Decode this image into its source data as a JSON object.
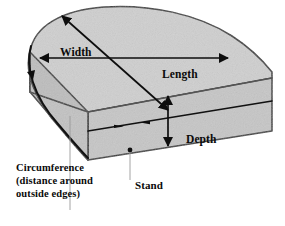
{
  "diagram": {
    "object_name": "mattress",
    "labels": {
      "width": "Width",
      "length": "Length",
      "depth": "Depth",
      "stand": "Stand",
      "circumference_line1": "Circumference",
      "circumference_line2": "(distance around",
      "circumference_line3": "outside edges)"
    },
    "colors": {
      "background": "#ffffff",
      "top_face": "#cfcfcf",
      "front_face": "#c6c6c6",
      "side_face": "#bdbdbd",
      "outline": "#3a3a3a",
      "arrow": "#0d0d0d",
      "text": "#0a0a0a",
      "leader_line": "#9a9a9a"
    },
    "callouts": [
      {
        "name": "width",
        "arrow": "double-horizontal",
        "measures": "top face left-to-right"
      },
      {
        "name": "length",
        "arrow": "double-diagonal",
        "measures": "top face front-to-back"
      },
      {
        "name": "depth",
        "arrow": "double-vertical",
        "measures": "front face thickness"
      },
      {
        "name": "circumference",
        "arrow": "outline-trace",
        "measures": "around outside edges"
      },
      {
        "name": "stand",
        "arrow": "leader-dot",
        "measures": "front face point"
      }
    ]
  }
}
